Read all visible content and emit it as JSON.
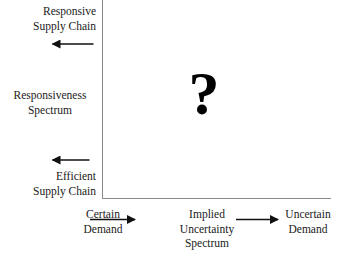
{
  "diagram": {
    "marker": {
      "symbol": "?",
      "name": "question-mark-marker"
    },
    "vertical_axis": {
      "top_label": "Responsive\nSupply Chain",
      "top_label_line1": "Responsive",
      "top_label_line2": "Supply Chain",
      "middle_label_line1": "Responsiveness",
      "middle_label_line2": "Spectrum",
      "bottom_label_line1": "Efficient",
      "bottom_label_line2": "Supply Chain",
      "up_arrow": "up-arrow",
      "down_arrow": "down-arrow"
    },
    "horizontal_axis": {
      "left_label_line1": "Certain",
      "left_label_line2": "Demand",
      "center_label_line1": "Implied",
      "center_label_line2": "Uncertainty",
      "center_label_line3": "Spectrum",
      "right_label_line1": "Uncertain",
      "right_label_line2": "Demand",
      "left_arrow": "left-arrow",
      "right_arrow": "right-arrow"
    },
    "colors": {
      "axis": "#8a8a8a",
      "text": "#1a1a1a",
      "arrow": "#111111",
      "marker": "#000000",
      "background": "#ffffff"
    }
  }
}
